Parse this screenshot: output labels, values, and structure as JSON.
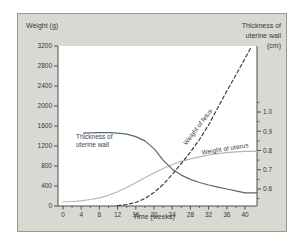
{
  "figure": {
    "left_axis_title": "Weight (g)",
    "right_axis_title_lines": [
      "Thickness of",
      "uterine wall",
      "(cm)"
    ],
    "x_axis_title": "Time (weeks)"
  },
  "colors": {
    "figure_background": "#d9d8d3",
    "plot_background": "#ffffff",
    "axis": "#4a4f52",
    "text": "#333a42",
    "fetus_curve": "#39424c",
    "uterus_curve": "#bcb5a6",
    "thickness_curve": "#546a79"
  },
  "chart_data": {
    "type": "line",
    "title": "",
    "xlabel": "Time (weeks)",
    "x_axis": {
      "ticks": [
        0,
        4,
        8,
        12,
        16,
        20,
        24,
        28,
        32,
        36,
        40
      ],
      "minor_ticks": [
        2,
        6,
        10,
        14,
        18,
        22,
        26,
        30,
        34,
        38
      ],
      "range": [
        0,
        40
      ]
    },
    "left_axis": {
      "label": "Weight (g)",
      "unit": "g",
      "ticks": [
        0,
        400,
        800,
        1200,
        1600,
        2000,
        2400,
        2800,
        3200
      ],
      "range": [
        0,
        3200
      ]
    },
    "right_axis": {
      "label": "Thickness of uterine wall (cm)",
      "unit": "cm",
      "ticks": [
        0.6,
        0.7,
        0.8,
        0.9,
        1.0
      ],
      "minor_ticks": [
        0.55,
        0.65,
        0.75,
        0.85,
        0.95,
        1.05
      ],
      "range": [
        0.55,
        1.05
      ]
    },
    "legend_position": "inline-labels",
    "grid": false,
    "series": [
      {
        "name": "Weight of fetus",
        "axis": "left",
        "style": "dashed",
        "color": "#39424c",
        "extend": "slope",
        "x": [
          12,
          14,
          16,
          18,
          20,
          22,
          24,
          26,
          28,
          30,
          32,
          34,
          36,
          38,
          40
        ],
        "y": [
          10,
          30,
          70,
          150,
          270,
          430,
          630,
          850,
          1080,
          1330,
          1620,
          1960,
          2300,
          2620,
          2950
        ]
      },
      {
        "name": "Weight of uterus",
        "axis": "left",
        "style": "solid",
        "color": "#bcb5a6",
        "extend": "flat",
        "x": [
          0,
          2,
          4,
          6,
          8,
          10,
          12,
          14,
          16,
          18,
          20,
          22,
          24,
          26,
          28,
          30,
          32,
          34,
          36,
          38,
          40
        ],
        "y": [
          80,
          90,
          105,
          130,
          165,
          215,
          285,
          370,
          465,
          565,
          660,
          750,
          830,
          895,
          945,
          985,
          1020,
          1048,
          1068,
          1082,
          1092
        ]
      },
      {
        "name": "Thickness of uterine wall",
        "label_lines": [
          "Thickness of",
          "uterine wall"
        ],
        "axis": "right",
        "style": "solid",
        "color": "#546a79",
        "extend": "flat",
        "x": [
          4.5,
          6,
          8,
          10,
          12,
          14,
          16,
          18,
          20,
          22,
          24,
          26,
          28,
          30,
          32,
          34,
          36,
          38,
          40
        ],
        "y": [
          0.89,
          0.892,
          0.893,
          0.893,
          0.89,
          0.885,
          0.872,
          0.85,
          0.81,
          0.75,
          0.703,
          0.672,
          0.65,
          0.634,
          0.621,
          0.61,
          0.6,
          0.59,
          0.58
        ]
      }
    ]
  }
}
